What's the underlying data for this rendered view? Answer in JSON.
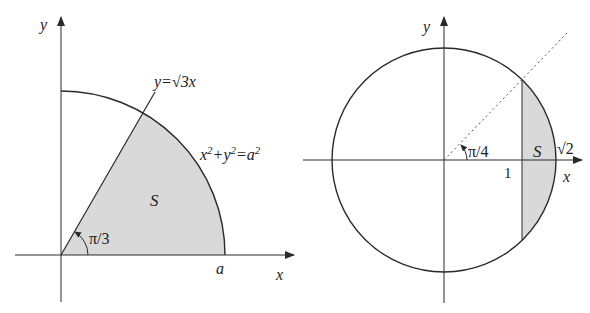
{
  "colors": {
    "stroke": "#2a2a2a",
    "fill": "#d9d9d9",
    "background": "#ffffff"
  },
  "left_figure": {
    "y_axis_label": "y",
    "x_axis_label": "x",
    "line_label": "y=√3x",
    "circle_label_parts": [
      "x",
      "2",
      "+y",
      "2",
      "=a",
      "2"
    ],
    "region_label": "S",
    "angle_label": "π/3",
    "radius_label": "a"
  },
  "right_figure": {
    "y_axis_label": "y",
    "x_axis_label": "x",
    "angle_label": "π/4",
    "region_label": "S",
    "tick_label_one": "1",
    "tick_label_sqrt2": "√2"
  }
}
